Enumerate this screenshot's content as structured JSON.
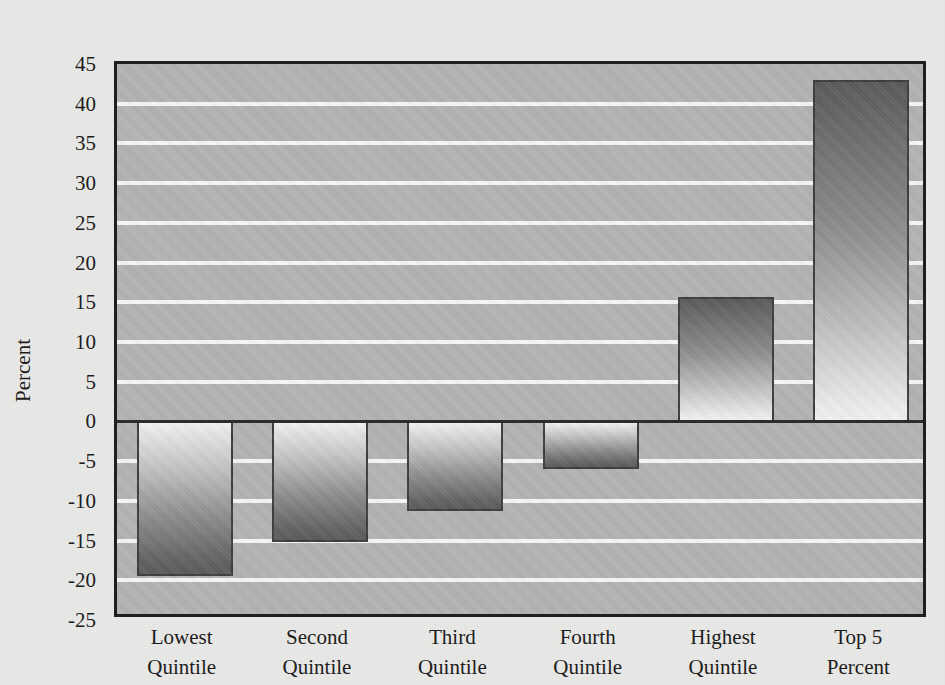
{
  "figure": {
    "axis_label_y": "Percent",
    "background_color": "#e9e9e7",
    "plot_background_color": "#b5b5b5",
    "gridline_color": "#fbfbfb",
    "bar_gradient_dark": "#585858",
    "bar_gradient_light": "#f6f6f6",
    "border_color": "#1c1c1c"
  },
  "chart_data": {
    "type": "bar",
    "title": "",
    "subtitle": "",
    "xlabel": "",
    "ylabel": "Percent",
    "ylim": [
      -25,
      45
    ],
    "ytick_step": 5,
    "grid": true,
    "legend": "none",
    "categories": [
      "Lowest Quintile",
      "Second Quintile",
      "Third Quintile",
      "Fourth Quintile",
      "Highest Quintile",
      "Top 5 Percent"
    ],
    "category_lines": [
      [
        "Lowest",
        "Quintile"
      ],
      [
        "Second",
        "Quintile"
      ],
      [
        "Third",
        "Quintile"
      ],
      [
        "Fourth",
        "Quintile"
      ],
      [
        "Highest",
        "Quintile"
      ],
      [
        "Top 5",
        "Percent"
      ]
    ],
    "values": [
      -19.5,
      -15.2,
      -11.3,
      -6.1,
      15.7,
      43.0
    ],
    "ytick_labels": [
      "45",
      "40",
      "35",
      "30",
      "25",
      "20",
      "15",
      "10",
      "5",
      "0",
      "-5",
      "-10",
      "-15",
      "-20",
      "-25"
    ],
    "ytick_values": [
      45,
      40,
      35,
      30,
      25,
      20,
      15,
      10,
      5,
      0,
      -5,
      -10,
      -15,
      -20,
      -25
    ]
  }
}
